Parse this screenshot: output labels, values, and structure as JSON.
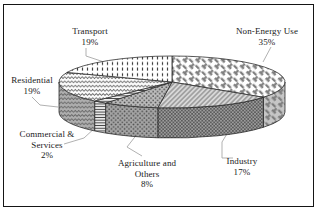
{
  "chart_data": {
    "type": "pie",
    "style": "3d",
    "title": "",
    "unit": "%",
    "order": "clockwise-from-top",
    "legend": "none",
    "slices": [
      {
        "name": "Non-Energy Use",
        "value": 35,
        "pct_label": "35%",
        "label_lines": [
          "Non-Energy Use",
          "35%"
        ],
        "top_pattern": "basket-weave",
        "rim_pattern": "basket-weave",
        "top_bg": "#ffffff",
        "rim_bg": "#c6c6c6"
      },
      {
        "name": "Industry",
        "value": 17,
        "pct_label": "17%",
        "label_lines": [
          "Industry",
          "17%"
        ],
        "top_pattern": "diagonal-hatch",
        "rim_pattern": "crosshatch",
        "top_bg": "#d8d8d8",
        "rim_bg": "#9c9c9c"
      },
      {
        "name": "Agriculture and Others",
        "value": 8,
        "pct_label": "8%",
        "label_lines": [
          "Agriculture and",
          "Others",
          "8%"
        ],
        "top_pattern": "dots",
        "rim_pattern": "dots",
        "top_bg": "#bcbcbc",
        "rim_bg": "#a4a4a4"
      },
      {
        "name": "Commercial & Services",
        "value": 2,
        "pct_label": "2%",
        "label_lines": [
          "Commercial &",
          "Services",
          "2%"
        ],
        "top_pattern": "horizontal-lines",
        "rim_pattern": "horizontal-lines",
        "top_bg": "#f2f2f2",
        "rim_bg": "#e9e9e9"
      },
      {
        "name": "Residential",
        "value": 19,
        "pct_label": "19%",
        "label_lines": [
          "Residential",
          "19%"
        ],
        "top_pattern": "waves",
        "rim_pattern": "waves",
        "top_bg": "#fbfbfb",
        "rim_bg": "#aeaeae"
      },
      {
        "name": "Transport",
        "value": 19,
        "pct_label": "19%",
        "label_lines": [
          "Transport",
          "19%"
        ],
        "top_pattern": "vertical-dashes",
        "rim_pattern": "vertical-dashes",
        "top_bg": "#ffffff",
        "rim_bg": "#cccccc"
      }
    ],
    "colors": {
      "stroke": "#232323",
      "leader_line": "#a8a8a8",
      "text": "#1a1a1a",
      "frame_border": "#151515",
      "background": "#ffffff"
    }
  }
}
